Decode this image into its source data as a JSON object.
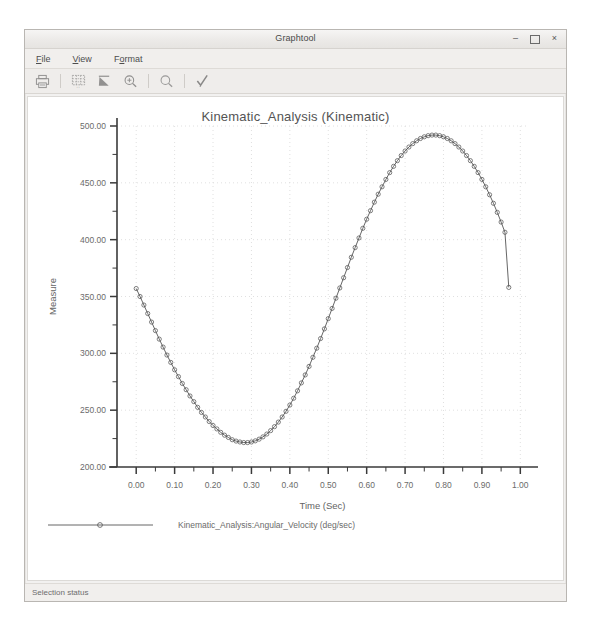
{
  "window": {
    "title": "Graphtool",
    "controls": [
      {
        "name": "minimize",
        "glyph": "–"
      },
      {
        "name": "maximize",
        "glyph": ""
      },
      {
        "name": "close",
        "glyph": "×"
      }
    ]
  },
  "menubar": {
    "items": [
      {
        "name": "file",
        "label": "File",
        "mnemonic": "F"
      },
      {
        "name": "view",
        "label": "View",
        "mnemonic": "V"
      },
      {
        "name": "format",
        "label": "Format",
        "mnemonic": "o"
      }
    ]
  },
  "toolbar": {
    "buttons": [
      {
        "name": "print-icon",
        "tooltip": "Print"
      },
      {
        "name": "grid-table-icon",
        "tooltip": "Show Data Table"
      },
      {
        "name": "edit-curve-icon",
        "tooltip": "Edit Curve"
      },
      {
        "name": "zoom-in-icon",
        "tooltip": "Zoom In"
      },
      {
        "name": "zoom-out-icon",
        "tooltip": "Zoom Out"
      },
      {
        "name": "apply-check-icon",
        "tooltip": "Apply"
      }
    ]
  },
  "statusbar": {
    "text": "Selection status"
  },
  "colors": {
    "window_bg": "#f2f1f0",
    "plot_bg": "#ffffff",
    "axis": "#3a3a3a",
    "grid": "#d8d8d8",
    "curve": "#555555",
    "text": "#6b6b6b"
  },
  "chart_data": {
    "type": "line",
    "title": "Kinematic_Analysis (Kinematic)",
    "xlabel": "Time (Sec)",
    "ylabel": "Measure",
    "xlim": [
      -0.05,
      1.02
    ],
    "ylim": [
      200,
      500
    ],
    "xticks": [
      "0.00",
      "0.10",
      "0.20",
      "0.30",
      "0.40",
      "0.50",
      "0.60",
      "0.70",
      "0.80",
      "0.90",
      "1.00"
    ],
    "xtick_values": [
      0.0,
      0.1,
      0.2,
      0.3,
      0.4,
      0.5,
      0.6,
      0.7,
      0.8,
      0.9,
      1.0
    ],
    "yticks": [
      "200.00",
      "250.00",
      "300.00",
      "350.00",
      "400.00",
      "450.00",
      "500.00"
    ],
    "ytick_values": [
      200,
      250,
      300,
      350,
      400,
      450,
      500
    ],
    "minor_ticks": true,
    "grid": true,
    "grid_style": "dotted",
    "legend_position": "bottom",
    "marker": "circle-open",
    "series": [
      {
        "name": "Kinematic_Analysis:Angular_Velocity (deg/sec)",
        "x": [
          0.0,
          0.01,
          0.02,
          0.03,
          0.04,
          0.05,
          0.06,
          0.07,
          0.08,
          0.09,
          0.1,
          0.11,
          0.12,
          0.13,
          0.14,
          0.15,
          0.16,
          0.17,
          0.18,
          0.19,
          0.2,
          0.21,
          0.22,
          0.23,
          0.24,
          0.25,
          0.26,
          0.27,
          0.28,
          0.29,
          0.3,
          0.31,
          0.32,
          0.33,
          0.34,
          0.35,
          0.36,
          0.37,
          0.38,
          0.39,
          0.4,
          0.41,
          0.42,
          0.43,
          0.44,
          0.45,
          0.46,
          0.47,
          0.48,
          0.49,
          0.5,
          0.51,
          0.52,
          0.53,
          0.54,
          0.55,
          0.56,
          0.57,
          0.58,
          0.59,
          0.6,
          0.61,
          0.62,
          0.63,
          0.64,
          0.65,
          0.66,
          0.67,
          0.68,
          0.69,
          0.7,
          0.71,
          0.72,
          0.73,
          0.74,
          0.75,
          0.76,
          0.77,
          0.78,
          0.79,
          0.8,
          0.81,
          0.82,
          0.83,
          0.84,
          0.85,
          0.86,
          0.87,
          0.88,
          0.89,
          0.9,
          0.91,
          0.92,
          0.93,
          0.94,
          0.95,
          0.96,
          0.97
        ],
        "y": [
          357.0,
          350.0,
          342.5,
          335.0,
          327.5,
          320.0,
          312.5,
          305.5,
          298.5,
          292.0,
          285.5,
          279.5,
          273.5,
          268.0,
          262.5,
          257.5,
          252.5,
          248.0,
          244.0,
          240.0,
          236.5,
          233.5,
          230.5,
          228.0,
          226.0,
          224.0,
          222.8,
          222.0,
          221.5,
          221.5,
          222.0,
          223.0,
          224.5,
          226.5,
          229.0,
          232.0,
          235.5,
          239.5,
          244.0,
          249.0,
          254.5,
          260.5,
          267.0,
          274.0,
          281.0,
          288.5,
          296.5,
          304.5,
          313.0,
          321.5,
          330.5,
          339.5,
          348.5,
          357.5,
          366.5,
          375.5,
          384.5,
          393.0,
          401.5,
          410.0,
          418.0,
          425.5,
          433.0,
          440.0,
          446.5,
          453.0,
          459.0,
          464.5,
          469.5,
          474.0,
          478.0,
          481.5,
          484.5,
          487.0,
          489.0,
          490.5,
          491.5,
          492.0,
          492.0,
          491.5,
          490.5,
          489.0,
          487.0,
          484.5,
          481.5,
          478.0,
          474.0,
          469.5,
          464.5,
          459.0,
          453.0,
          446.5,
          439.5,
          432.0,
          424.0,
          415.5,
          406.5,
          358.0
        ]
      }
    ]
  }
}
